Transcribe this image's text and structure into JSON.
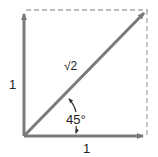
{
  "diagram": {
    "title": "",
    "labels": {
      "vertical_side": "1",
      "horizontal_side": "1",
      "hypotenuse": "√2",
      "angle": "45°"
    },
    "colors": {
      "arrow": "#7a7a7a",
      "dashed": "#a8a8a8",
      "text": "#222222"
    }
  }
}
